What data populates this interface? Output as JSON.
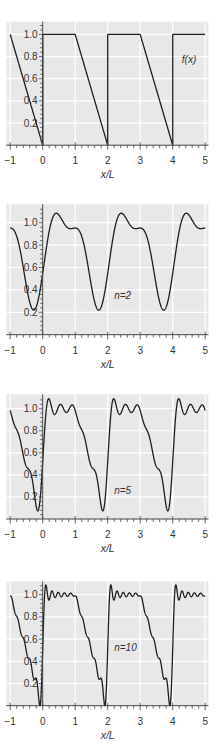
{
  "chart_data": [
    {
      "type": "line",
      "panel": "f(x)",
      "title": "",
      "series_label": "f(x)",
      "series_label_pos": [
        4.28,
        0.77
      ],
      "n_terms": null,
      "xlabel": "x/L",
      "ylabel": "",
      "xlim": [
        -1.12,
        5.1
      ],
      "ylim": [
        0,
        1.115
      ],
      "xticks": [
        -1,
        0,
        1,
        2,
        3,
        4,
        5
      ],
      "xtick_labels": [
        "−1",
        "0",
        "1",
        "2",
        "3",
        "4",
        "5"
      ],
      "yticks": [
        0.2,
        0.4,
        0.6,
        0.8,
        1.0
      ],
      "ytick_labels": [
        "0.2",
        "0.4",
        "0.6",
        "0.8",
        "1.0"
      ],
      "grid": true,
      "x": [
        -1,
        -0.75,
        -0.5,
        -0.25,
        0,
        0.25,
        0.5,
        0.75,
        1,
        1.25,
        1.5,
        1.75,
        2,
        2.25,
        2.5,
        2.75,
        3,
        3.25,
        3.5,
        3.75,
        4,
        4.25,
        4.5,
        4.75,
        5
      ],
      "values": [
        1.0,
        0.75,
        0.5,
        0.25,
        1.0,
        1.0,
        1.0,
        1.0,
        1.0,
        0.75,
        0.5,
        0.25,
        1.0,
        1.0,
        1.0,
        1.0,
        1.0,
        0.75,
        0.5,
        0.25,
        1.0,
        1.0,
        1.0,
        1.0,
        1.0
      ]
    },
    {
      "type": "line",
      "panel": "n=2",
      "title": "",
      "series_label": "n=2",
      "series_label_pos": [
        2.2,
        0.35
      ],
      "n_terms": 2,
      "xlabel": "x/L",
      "ylabel": "",
      "xlim": [
        -1.12,
        5.1
      ],
      "ylim": [
        0,
        1.165
      ],
      "xticks": [
        -1,
        0,
        1,
        2,
        3,
        4,
        5
      ],
      "xtick_labels": [
        "−1",
        "0",
        "1",
        "2",
        "3",
        "4",
        "5"
      ],
      "yticks": [
        0.2,
        0.4,
        0.6,
        0.8,
        1.0
      ],
      "ytick_labels": [
        "0.2",
        "0.4",
        "0.6",
        "0.8",
        "1.0"
      ],
      "grid": true,
      "x": [
        -1,
        -0.75,
        -0.5,
        -0.25,
        0,
        0.25,
        0.5,
        0.75,
        1,
        1.25,
        1.5,
        1.75,
        2,
        2.25,
        2.5,
        2.75,
        3,
        3.25,
        3.5,
        3.75,
        4,
        4.25,
        4.5,
        4.75,
        5
      ],
      "values": [
        0.953,
        0.827,
        0.432,
        0.222,
        0.547,
        0.991,
        1.068,
        0.959,
        0.953,
        0.827,
        0.432,
        0.222,
        0.547,
        0.991,
        1.068,
        0.959,
        0.953,
        0.827,
        0.432,
        0.222,
        0.547,
        0.991,
        1.068,
        0.959,
        0.953
      ]
    },
    {
      "type": "line",
      "panel": "n=5",
      "title": "",
      "series_label": "n=5",
      "series_label_pos": [
        2.2,
        0.26
      ],
      "n_terms": 5,
      "xlabel": "x/L",
      "ylabel": "",
      "xlim": [
        -1.12,
        5.1
      ],
      "ylim": [
        0,
        1.13
      ],
      "xticks": [
        -1,
        0,
        1,
        2,
        3,
        4,
        5
      ],
      "xtick_labels": [
        "−1",
        "0",
        "1",
        "2",
        "3",
        "4",
        "5"
      ],
      "yticks": [
        0.2,
        0.4,
        0.6,
        0.8,
        1.0
      ],
      "ytick_labels": [
        "0.2",
        "0.4",
        "0.6",
        "0.8",
        "1.0"
      ],
      "grid": true,
      "x": [
        -1,
        -0.75,
        -0.5,
        -0.25,
        0,
        0.25,
        0.5,
        0.75,
        1,
        1.25,
        1.5,
        1.75,
        2,
        2.25,
        2.5,
        2.75,
        3,
        3.25,
        3.5,
        3.75,
        4,
        4.25,
        4.5,
        4.75,
        5
      ],
      "values": [
        0.983,
        0.776,
        0.474,
        0.214,
        0.517,
        1.043,
        1.026,
        0.968,
        0.983,
        0.776,
        0.474,
        0.214,
        0.517,
        1.043,
        1.026,
        0.968,
        0.983,
        0.776,
        0.474,
        0.214,
        0.517,
        1.043,
        1.026,
        0.968,
        0.983
      ]
    },
    {
      "type": "line",
      "panel": "n=10",
      "title": "",
      "series_label": "n=10",
      "series_label_pos": [
        2.2,
        0.52
      ],
      "n_terms": 10,
      "xlabel": "x/L",
      "ylabel": "",
      "xlim": [
        -1.12,
        5.1
      ],
      "ylim": [
        0,
        1.12
      ],
      "xticks": [
        -1,
        0,
        1,
        2,
        3,
        4,
        5
      ],
      "xtick_labels": [
        "−1",
        "0",
        "1",
        "2",
        "3",
        "4",
        "5"
      ],
      "yticks": [
        0.2,
        0.4,
        0.6,
        0.8,
        1.0
      ],
      "ytick_labels": [
        "0.2",
        "0.4",
        "0.6",
        "0.8",
        "1.0"
      ],
      "grid": true,
      "x": [
        -1,
        -0.75,
        -0.5,
        -0.25,
        0,
        0.25,
        0.5,
        0.75,
        1,
        1.25,
        1.5,
        1.75,
        2,
        2.25,
        2.5,
        2.75,
        3,
        3.25,
        3.5,
        3.75,
        4,
        4.25,
        4.5,
        4.75,
        5
      ],
      "values": [
        0.99,
        0.767,
        0.484,
        0.238,
        0.51,
        1.01,
        1.016,
        0.987,
        0.99,
        0.767,
        0.484,
        0.238,
        0.51,
        1.01,
        1.016,
        0.987,
        0.99,
        0.767,
        0.484,
        0.238,
        0.51,
        1.01,
        1.016,
        0.987,
        0.99
      ]
    }
  ],
  "function": {
    "description": "f(x)=1 on [0,1), f(x)=2-x on [1,2), period 2 in x/L; panels show Fourier partial sums with n terms",
    "period": 2,
    "mean": 0.75
  },
  "colors": {
    "plot_background": "#e8e8e8",
    "grid": "#ffffff",
    "curve": "#1e1e1e",
    "axis": "#444444",
    "text": "#333333"
  },
  "layout": {
    "x_origin_px": 42.7,
    "x_scale_px": 32.5,
    "panels": [
      {
        "baseline_px": 145.2,
        "y_scale_px": 110.8
      },
      {
        "baseline_px": 334.7,
        "y_scale_px": 112.0
      },
      {
        "baseline_px": 519.0,
        "y_scale_px": 110.3
      },
      {
        "baseline_px": 705.7,
        "y_scale_px": 111.0
      }
    ]
  }
}
